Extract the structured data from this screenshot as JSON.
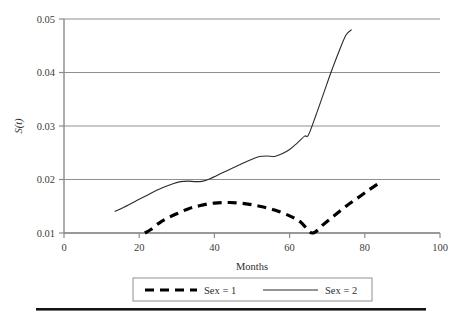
{
  "chart_data": {
    "type": "line",
    "title": "",
    "xlabel": "Months",
    "ylabel": "S(t)",
    "xlim": [
      0,
      100
    ],
    "ylim": [
      0.01,
      0.05
    ],
    "grid": "horizontal",
    "legend_position": "bottom",
    "xticks": [
      "0",
      "20",
      "40",
      "60",
      "80",
      "100"
    ],
    "xtick_values": [
      0,
      20,
      40,
      60,
      80,
      100
    ],
    "yticks": [
      "0.01",
      "0.02",
      "0.03",
      "0.04",
      "0.05"
    ],
    "ytick_values": [
      0.01,
      0.02,
      0.03,
      0.04,
      0.05
    ],
    "series": [
      {
        "name": "Sex = 1",
        "style": "dashed",
        "color": "#000000",
        "width": 3.2,
        "x": [
          21.5,
          23,
          25,
          27,
          30,
          33,
          36,
          40,
          44,
          48,
          52,
          56,
          60,
          63,
          66,
          69,
          72,
          75,
          78,
          81,
          83.5
        ],
        "y": [
          0.01,
          0.0106,
          0.0117,
          0.0126,
          0.0136,
          0.0145,
          0.0151,
          0.0156,
          0.0157,
          0.0155,
          0.015,
          0.0143,
          0.0132,
          0.012,
          0.01,
          0.0116,
          0.0133,
          0.015,
          0.0165,
          0.018,
          0.0192
        ]
      },
      {
        "name": "Sex = 2",
        "style": "solid",
        "color": "#2b2b2b",
        "width": 1.1,
        "x": [
          13.5,
          17,
          20,
          23,
          26,
          29,
          31,
          33,
          35,
          37,
          39,
          42,
          45,
          48,
          50,
          52,
          54,
          56,
          58,
          60,
          62,
          64,
          65,
          67,
          69,
          71,
          73,
          75,
          76.5
        ],
        "y": [
          0.014,
          0.0152,
          0.0163,
          0.0174,
          0.0184,
          0.0192,
          0.0196,
          0.0197,
          0.0196,
          0.0197,
          0.0202,
          0.0212,
          0.0222,
          0.0232,
          0.0238,
          0.0243,
          0.0244,
          0.0243,
          0.0248,
          0.0256,
          0.0268,
          0.0281,
          0.0283,
          0.032,
          0.036,
          0.04,
          0.0437,
          0.047,
          0.048
        ]
      }
    ]
  },
  "legend": {
    "entries": [
      {
        "label": "Sex = 1"
      },
      {
        "label": "Sex = 2"
      }
    ]
  }
}
